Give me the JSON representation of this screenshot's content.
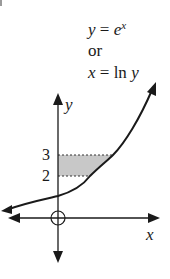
{
  "diagram": {
    "equation_lines": {
      "line1_lhs": "y",
      "line1_eq": " = ",
      "line1_base": "e",
      "line1_exp": "x",
      "line2": "or",
      "line3_lhs": "x",
      "line3_eq": " = ",
      "line3_fn": "ln",
      "line3_arg": "y"
    },
    "axes": {
      "x_label": "x",
      "y_label": "y",
      "origin_marker": "circle-cross"
    },
    "tick_labels": {
      "upper": "3",
      "lower": "2"
    },
    "curve": "y = e^x",
    "shaded_region": {
      "y_from": 2,
      "y_to": 3,
      "bounded_by": "y-axis and curve",
      "fill_color": "#c8c8c8"
    },
    "colors": {
      "ink": "#1a1a1a",
      "background": "#ffffff",
      "shade": "#c8c8c8"
    }
  }
}
